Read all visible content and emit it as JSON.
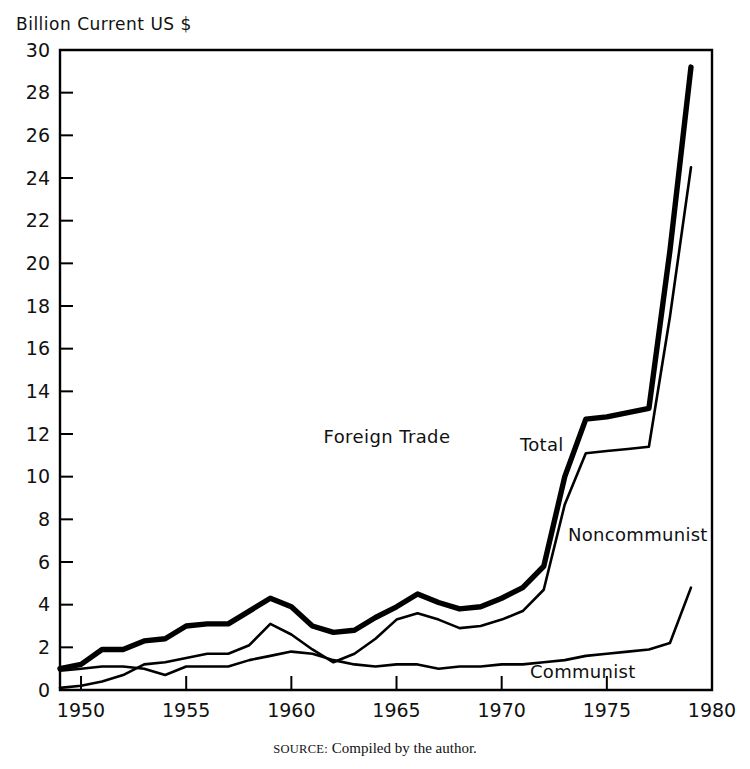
{
  "axis_label": "Billion Current US $",
  "source": {
    "prefix": "SOURCE:",
    "text": "Compiled by the author."
  },
  "annotations": {
    "plot_title": "Foreign Trade",
    "total_label": "Total",
    "noncommunist_label": "Noncommunist",
    "communist_label": "Communist"
  },
  "chart_data": {
    "type": "line",
    "title": "Foreign Trade",
    "xlabel": "",
    "ylabel": "Billion Current US $",
    "xlim": [
      1949,
      1980
    ],
    "ylim": [
      0,
      30
    ],
    "ytick_step": 2,
    "grid": false,
    "legend_position": "inline-annotations",
    "accent_color": "#000000",
    "yticks": [
      0,
      2,
      4,
      6,
      8,
      10,
      12,
      14,
      16,
      18,
      20,
      22,
      24,
      26,
      28,
      30
    ],
    "ytick_labels": [
      "0",
      "2",
      "4",
      "6",
      "8",
      "10",
      "12",
      "14",
      "16",
      "18",
      "20",
      "22",
      "24",
      "26",
      "28",
      "30"
    ],
    "xticks": [
      1950,
      1955,
      1960,
      1965,
      1970,
      1975,
      1980
    ],
    "xtick_labels": [
      "1950",
      "1955",
      "1960",
      "1965",
      "1970",
      "1975",
      "1980"
    ],
    "x": [
      1949,
      1950,
      1951,
      1952,
      1953,
      1954,
      1955,
      1956,
      1957,
      1958,
      1959,
      1960,
      1961,
      1962,
      1963,
      1964,
      1965,
      1966,
      1967,
      1968,
      1969,
      1970,
      1971,
      1972,
      1973,
      1974,
      1975,
      1976,
      1977,
      1978,
      1979
    ],
    "series": [
      {
        "name": "Total",
        "values": [
          1.0,
          1.2,
          1.9,
          1.9,
          2.3,
          2.4,
          3.0,
          3.1,
          3.1,
          3.7,
          4.3,
          3.9,
          3.0,
          2.7,
          2.8,
          3.4,
          3.9,
          4.5,
          4.1,
          3.8,
          3.9,
          4.3,
          4.8,
          5.8,
          10.0,
          12.7,
          12.8,
          13.0,
          13.2,
          20.6,
          29.2
        ]
      },
      {
        "name": "Noncommunist",
        "values": [
          0.1,
          0.2,
          0.4,
          0.7,
          1.2,
          1.3,
          1.5,
          1.7,
          1.7,
          2.1,
          3.1,
          2.6,
          1.9,
          1.3,
          1.7,
          2.4,
          3.3,
          3.6,
          3.3,
          2.9,
          3.0,
          3.3,
          3.7,
          4.7,
          8.7,
          11.1,
          11.2,
          11.3,
          11.4,
          17.5,
          24.5
        ]
      },
      {
        "name": "Communist",
        "values": [
          0.9,
          1.0,
          1.1,
          1.1,
          1.0,
          0.7,
          1.1,
          1.1,
          1.1,
          1.4,
          1.6,
          1.8,
          1.7,
          1.4,
          1.2,
          1.1,
          1.2,
          1.2,
          1.0,
          1.1,
          1.1,
          1.2,
          1.2,
          1.3,
          1.4,
          1.6,
          1.7,
          1.8,
          1.9,
          2.2,
          4.8
        ]
      }
    ]
  }
}
